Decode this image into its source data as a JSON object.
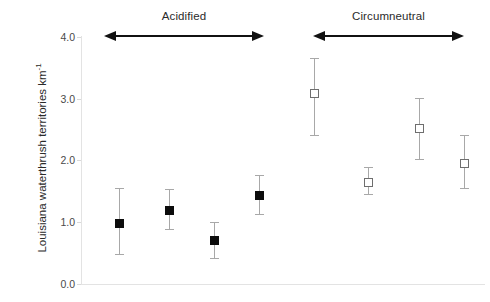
{
  "chart_data": {
    "type": "scatter",
    "title": "",
    "xlabel": "",
    "ylabel": "Louisiana waterthrush territories km-1",
    "ylabel_text": "Louisiana waterthrush territories km",
    "ylabel_superscript": "-1",
    "ylim": [
      0.0,
      4.0
    ],
    "ytick_labels": [
      "0.0",
      "1.0",
      "2.0",
      "3.0",
      "4.0"
    ],
    "ytick_values": [
      0.0,
      1.0,
      2.0,
      3.0,
      4.0
    ],
    "grid": false,
    "legend": "none",
    "error_bars": "mean with upper and lower error bars",
    "groups": [
      {
        "name": "Acidified",
        "marker": "filled-square",
        "marker_color": "#0c0c0c",
        "arrow": "double-headed",
        "points": [
          {
            "index": 1,
            "x_px": 119,
            "value": 0.98,
            "upper": 1.56,
            "lower": 0.49
          },
          {
            "index": 2,
            "x_px": 169,
            "value": 1.19,
            "upper": 1.53,
            "lower": 0.89
          },
          {
            "index": 3,
            "x_px": 214,
            "value": 0.7,
            "upper": 1.01,
            "lower": 0.42
          },
          {
            "index": 4,
            "x_px": 259,
            "value": 1.43,
            "upper": 1.76,
            "lower": 1.14
          }
        ]
      },
      {
        "name": "Circumneutral",
        "marker": "open-square",
        "marker_color": "#ffffff",
        "arrow": "double-headed",
        "points": [
          {
            "index": 1,
            "x_px": 314,
            "value": 3.09,
            "upper": 3.66,
            "lower": 2.41
          },
          {
            "index": 2,
            "x_px": 368,
            "value": 1.64,
            "upper": 1.9,
            "lower": 1.46
          },
          {
            "index": 3,
            "x_px": 419,
            "value": 2.52,
            "upper": 3.01,
            "lower": 2.03
          },
          {
            "index": 4,
            "x_px": 464,
            "value": 1.95,
            "upper": 2.41,
            "lower": 1.56
          }
        ]
      }
    ],
    "colors": {
      "axis": "#e3e3e3",
      "tick_text": "#4a4a4a",
      "label_text": "#2b2b2b",
      "error_bar": "#a8a8a8",
      "filled_marker": "#0c0c0c",
      "open_marker_edge": "#6e6e6e",
      "background": "#ffffff"
    }
  },
  "axis_geometry": {
    "y_zero_px": 284,
    "px_per_unit": 61.8,
    "plot_left_px": 81,
    "plot_right_px": 485
  },
  "annotations": {
    "acidified_arrow_left_px": 104,
    "acidified_arrow_right_px": 264,
    "circumneutral_arrow_left_px": 313,
    "circumneutral_arrow_right_px": 464,
    "arrow_y_px": 36
  }
}
